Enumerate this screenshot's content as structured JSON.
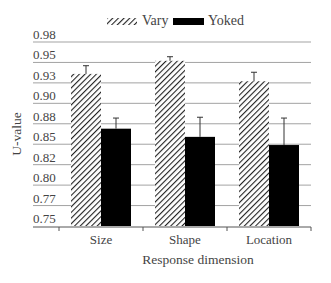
{
  "chart_data": {
    "type": "bar",
    "title": "",
    "xlabel": "Response dimension",
    "ylabel": "U-value",
    "categories": [
      "Size",
      "Shape",
      "Location"
    ],
    "series": [
      {
        "name": "Vary",
        "pattern": "hatched",
        "values": [
          0.936,
          0.952,
          0.927
        ],
        "error_upper": [
          0.946,
          0.957,
          0.938
        ]
      },
      {
        "name": "Yoked",
        "pattern": "solid",
        "color": "#000000",
        "values": [
          0.869,
          0.859,
          0.849
        ],
        "error_upper": [
          0.882,
          0.883,
          0.882
        ]
      }
    ],
    "ylim": [
      0.75,
      0.975
    ],
    "yticks": [
      0.75,
      0.775,
      0.8,
      0.825,
      0.85,
      0.875,
      0.9,
      0.925,
      0.95,
      0.975
    ],
    "ytick_labels": [
      "0.75",
      "0.77",
      "0.80",
      "0.82",
      "0.85",
      "0.88",
      "0.90",
      "0.93",
      "0.95",
      "0.98"
    ],
    "grid": true,
    "legend_position": "top-center"
  },
  "legend": {
    "vary_label": "Vary",
    "yoked_label": "Yoked"
  },
  "axes": {
    "xlabel": "Response dimension",
    "ylabel": "U-value"
  }
}
